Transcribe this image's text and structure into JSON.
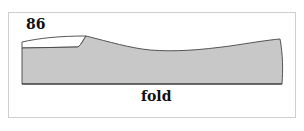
{
  "diagram": {
    "size_label": "86",
    "fold_label": "fold",
    "colors": {
      "fill": "#c8c8c8",
      "stroke": "#444444",
      "frame": "#cfcfcf"
    }
  }
}
